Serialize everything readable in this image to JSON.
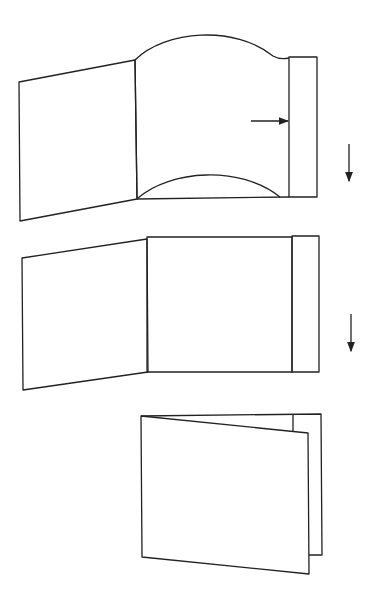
{
  "diagram": {
    "type": "folding-sequence",
    "stroke_color": "#222222",
    "background": "#ffffff",
    "steps": [
      {
        "id": "step-1",
        "description": "open folder with bowed middle page being pushed into right pocket",
        "arrows": [
          "push-right",
          "down"
        ]
      },
      {
        "id": "step-2",
        "description": "open folder with page flat in pocket",
        "arrows": [
          "down"
        ]
      },
      {
        "id": "step-3",
        "description": "closed folder",
        "arrows": []
      }
    ]
  }
}
